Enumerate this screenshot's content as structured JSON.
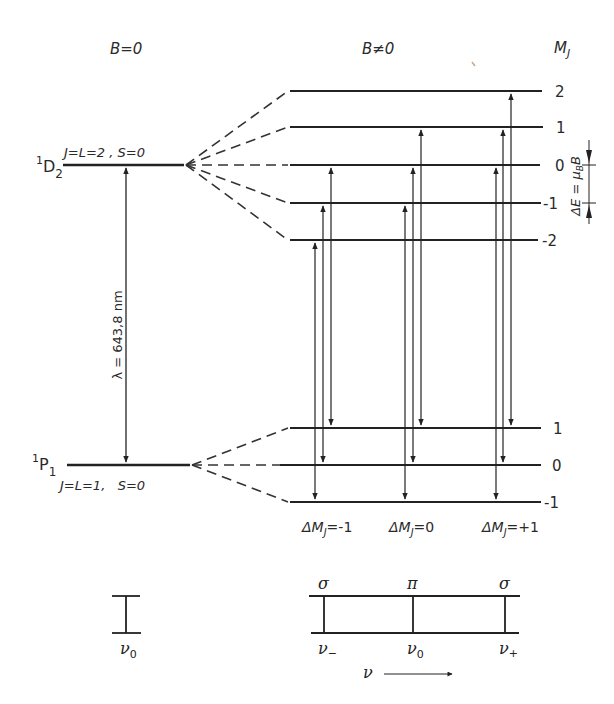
{
  "diagram": {
    "title_left": "B=0",
    "title_right": "B≠0",
    "mj_header": "M",
    "mj_header_sub": "J",
    "upper_term": {
      "symbol_sup": "1",
      "symbol": "D",
      "symbol_sub": "2",
      "quantum_numbers": "J=L=2 , S=0"
    },
    "lower_term": {
      "symbol_sup": "1",
      "symbol": "P",
      "symbol_sub": "1",
      "quantum_numbers": "J=L=1,   S=0"
    },
    "wavelength_label": "λ = 643,8 nm",
    "splitting_label": "ΔE = μ",
    "splitting_label_sub": "B",
    "splitting_label_tail": "B",
    "upper_sublevels": [
      {
        "mj": "2"
      },
      {
        "mj": "1"
      },
      {
        "mj": "0"
      },
      {
        "mj": "-1"
      },
      {
        "mj": "-2"
      }
    ],
    "lower_sublevels": [
      {
        "mj": "1"
      },
      {
        "mj": "0"
      },
      {
        "mj": "-1"
      }
    ],
    "transition_groups": [
      {
        "label": "ΔM",
        "sub": "J",
        "value": "=-1",
        "transitions": [
          "-2 → -1",
          "-1 → 0",
          "0 → 1"
        ]
      },
      {
        "label": "ΔM",
        "sub": "J",
        "value": "=0",
        "transitions": [
          "-1 → -1",
          "0 → 0",
          "1 → 1"
        ]
      },
      {
        "label": "ΔM",
        "sub": "J",
        "value": "=+1",
        "transitions": [
          "0 → -1",
          "1 → 0",
          "2 → 1"
        ]
      }
    ],
    "spectrum_left": {
      "line_label": "ν",
      "line_sub": "0"
    },
    "spectrum_right": {
      "polarizations": [
        "σ",
        "π",
        "σ"
      ],
      "frequencies": [
        {
          "main": "ν",
          "sub": "−"
        },
        {
          "main": "ν",
          "sub": "0"
        },
        {
          "main": "ν",
          "sub": "+"
        }
      ],
      "axis_label": "ν"
    }
  }
}
